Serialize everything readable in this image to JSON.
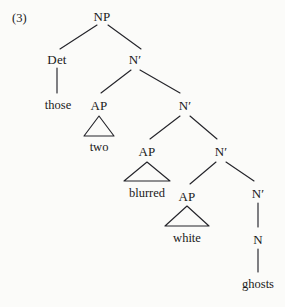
{
  "figure": {
    "example_number": "(3)",
    "kind": "syntax-tree",
    "colors": {
      "background": "#fbfbf9",
      "ink": "#24242a",
      "text": "#1a1a1a"
    }
  },
  "nodes": [
    {
      "id": "np",
      "label": "NP",
      "x": 102,
      "y": 10,
      "type": "category"
    },
    {
      "id": "det",
      "label": "Det",
      "x": 57,
      "y": 53,
      "type": "category"
    },
    {
      "id": "nbar1",
      "label": "N′",
      "x": 135,
      "y": 53,
      "type": "category"
    },
    {
      "id": "those",
      "label": "those",
      "x": 58,
      "y": 99,
      "type": "terminal"
    },
    {
      "id": "ap1",
      "label": "AP",
      "x": 99,
      "y": 99,
      "type": "category"
    },
    {
      "id": "nbar2",
      "label": "N′",
      "x": 185,
      "y": 99,
      "type": "category"
    },
    {
      "id": "two",
      "label": "two",
      "x": 99,
      "y": 141,
      "type": "terminal"
    },
    {
      "id": "ap2",
      "label": "AP",
      "x": 147,
      "y": 145,
      "type": "category"
    },
    {
      "id": "nbar3",
      "label": "N′",
      "x": 221,
      "y": 145,
      "type": "category"
    },
    {
      "id": "blurred",
      "label": "blurred",
      "x": 147,
      "y": 187,
      "type": "terminal"
    },
    {
      "id": "ap3",
      "label": "AP",
      "x": 187,
      "y": 190,
      "type": "category"
    },
    {
      "id": "nbar4",
      "label": "N′",
      "x": 258,
      "y": 187,
      "type": "category"
    },
    {
      "id": "white",
      "label": "white",
      "x": 187,
      "y": 232,
      "type": "terminal"
    },
    {
      "id": "n",
      "label": "N",
      "x": 258,
      "y": 233,
      "type": "category"
    },
    {
      "id": "ghosts",
      "label": "ghosts",
      "x": 258,
      "y": 278,
      "type": "terminal"
    }
  ],
  "branches": [
    {
      "from": "np",
      "to": "det",
      "x1": 97,
      "y1": 25,
      "x2": 60,
      "y2": 49
    },
    {
      "from": "np",
      "to": "nbar1",
      "x1": 108,
      "y1": 25,
      "x2": 141,
      "y2": 49
    },
    {
      "from": "det",
      "to": "those",
      "x1": 57,
      "y1": 68,
      "x2": 57,
      "y2": 93
    },
    {
      "from": "nbar1",
      "to": "ap1",
      "x1": 131,
      "y1": 70,
      "x2": 101,
      "y2": 93
    },
    {
      "from": "nbar1",
      "to": "nbar2",
      "x1": 140,
      "y1": 70,
      "x2": 180,
      "y2": 93
    },
    {
      "from": "nbar2",
      "to": "ap2",
      "x1": 180,
      "y1": 116,
      "x2": 150,
      "y2": 139
    },
    {
      "from": "nbar2",
      "to": "nbar3",
      "x1": 190,
      "y1": 116,
      "x2": 217,
      "y2": 139
    },
    {
      "from": "nbar3",
      "to": "ap3",
      "x1": 216,
      "y1": 162,
      "x2": 190,
      "y2": 184
    },
    {
      "from": "nbar3",
      "to": "nbar4",
      "x1": 226,
      "y1": 162,
      "x2": 254,
      "y2": 181
    },
    {
      "from": "nbar4",
      "to": "n",
      "x1": 258,
      "y1": 203,
      "x2": 258,
      "y2": 227
    },
    {
      "from": "n",
      "to": "ghosts",
      "x1": 258,
      "y1": 249,
      "x2": 258,
      "y2": 272
    }
  ],
  "triangles": [
    {
      "for": "ap1",
      "covers": "two",
      "apex_x": 99,
      "apex_y": 116,
      "left_x": 84,
      "right_x": 114,
      "base_y": 136
    },
    {
      "for": "ap2",
      "covers": "blurred",
      "apex_x": 147,
      "apex_y": 162,
      "left_x": 124,
      "right_x": 170,
      "base_y": 181
    },
    {
      "for": "ap3",
      "covers": "white",
      "apex_x": 187,
      "apex_y": 206,
      "left_x": 165,
      "right_x": 209,
      "base_y": 226
    }
  ],
  "phrase": {
    "words": [
      "those",
      "two",
      "blurred",
      "white",
      "ghosts"
    ],
    "text": "those two blurred white ghosts"
  }
}
